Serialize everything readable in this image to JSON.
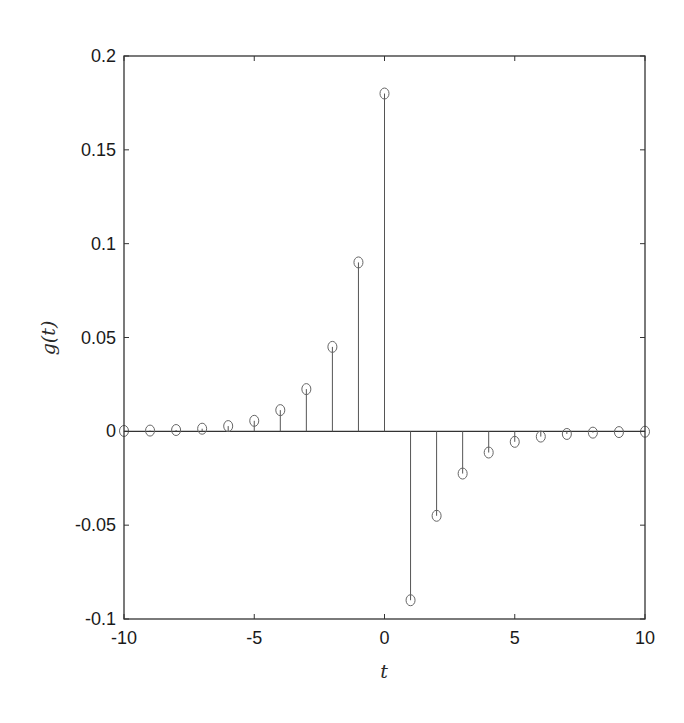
{
  "chart_data": {
    "type": "stem",
    "title": "",
    "xlabel": "t",
    "ylabel": "g(t)",
    "xlim": [
      -10,
      10
    ],
    "ylim": [
      -0.1,
      0.2
    ],
    "xticks": [
      -10,
      -5,
      0,
      5,
      10
    ],
    "xtick_labels": [
      "-10",
      "-5",
      "0",
      "5",
      "10"
    ],
    "yticks": [
      -0.1,
      -0.05,
      0,
      0.05,
      0.1,
      0.15,
      0.2
    ],
    "ytick_labels": [
      "-0.1",
      "-0.05",
      "0",
      "0.05",
      "0.1",
      "0.15",
      "0.2"
    ],
    "grid": false,
    "legend": null,
    "marker": "open-circle",
    "x": [
      -10,
      -9,
      -8,
      -7,
      -6,
      -5,
      -4,
      -3,
      -2,
      -1,
      0,
      1,
      2,
      3,
      4,
      5,
      6,
      7,
      8,
      9,
      10
    ],
    "values": [
      0.0002,
      0.0004,
      0.0007,
      0.0014,
      0.0028,
      0.0056,
      0.0113,
      0.0225,
      0.045,
      0.09,
      0.18,
      -0.09,
      -0.045,
      -0.0225,
      -0.0113,
      -0.0056,
      -0.0028,
      -0.0014,
      -0.0007,
      -0.0004,
      -0.0002
    ]
  },
  "colors": {
    "axis": "#333333",
    "stem": "#555555",
    "marker": "#666666",
    "background": "#ffffff"
  }
}
